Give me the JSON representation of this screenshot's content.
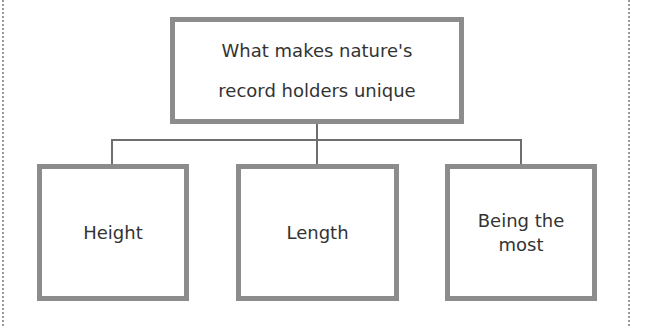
{
  "diagram": {
    "root": {
      "label": "What makes nature's record holders unique"
    },
    "children": [
      {
        "label": "Height"
      },
      {
        "label": "Length"
      },
      {
        "label": "Being the most"
      }
    ],
    "colors": {
      "box_border": "#8c8c8c",
      "connector": "#6e6e6e",
      "text": "#333333"
    }
  }
}
